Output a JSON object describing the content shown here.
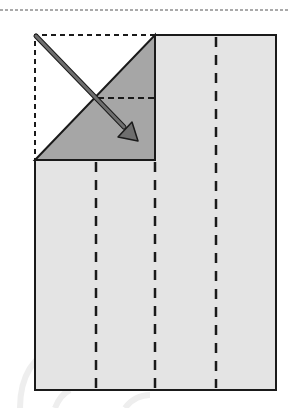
{
  "diagram": {
    "type": "origami-fold-step",
    "colors": {
      "paper": "#e4e4e4",
      "folded_flap": "#a6a6a6",
      "outline": "#1a1a1a",
      "arrow": "#6e6e6e",
      "background": "#ffffff"
    },
    "elements": {
      "top_separator": "dotted-line",
      "paper": "rectangle-with-folded-corner",
      "fold_lines": [
        "valley-fold-dashed-x96",
        "valley-fold-dashed-x155",
        "valley-fold-dashed-x216",
        "horizontal-dashed-in-flap"
      ],
      "original_corner_outline": "dashed-square",
      "arrow": "fold-direction-arrow"
    }
  }
}
